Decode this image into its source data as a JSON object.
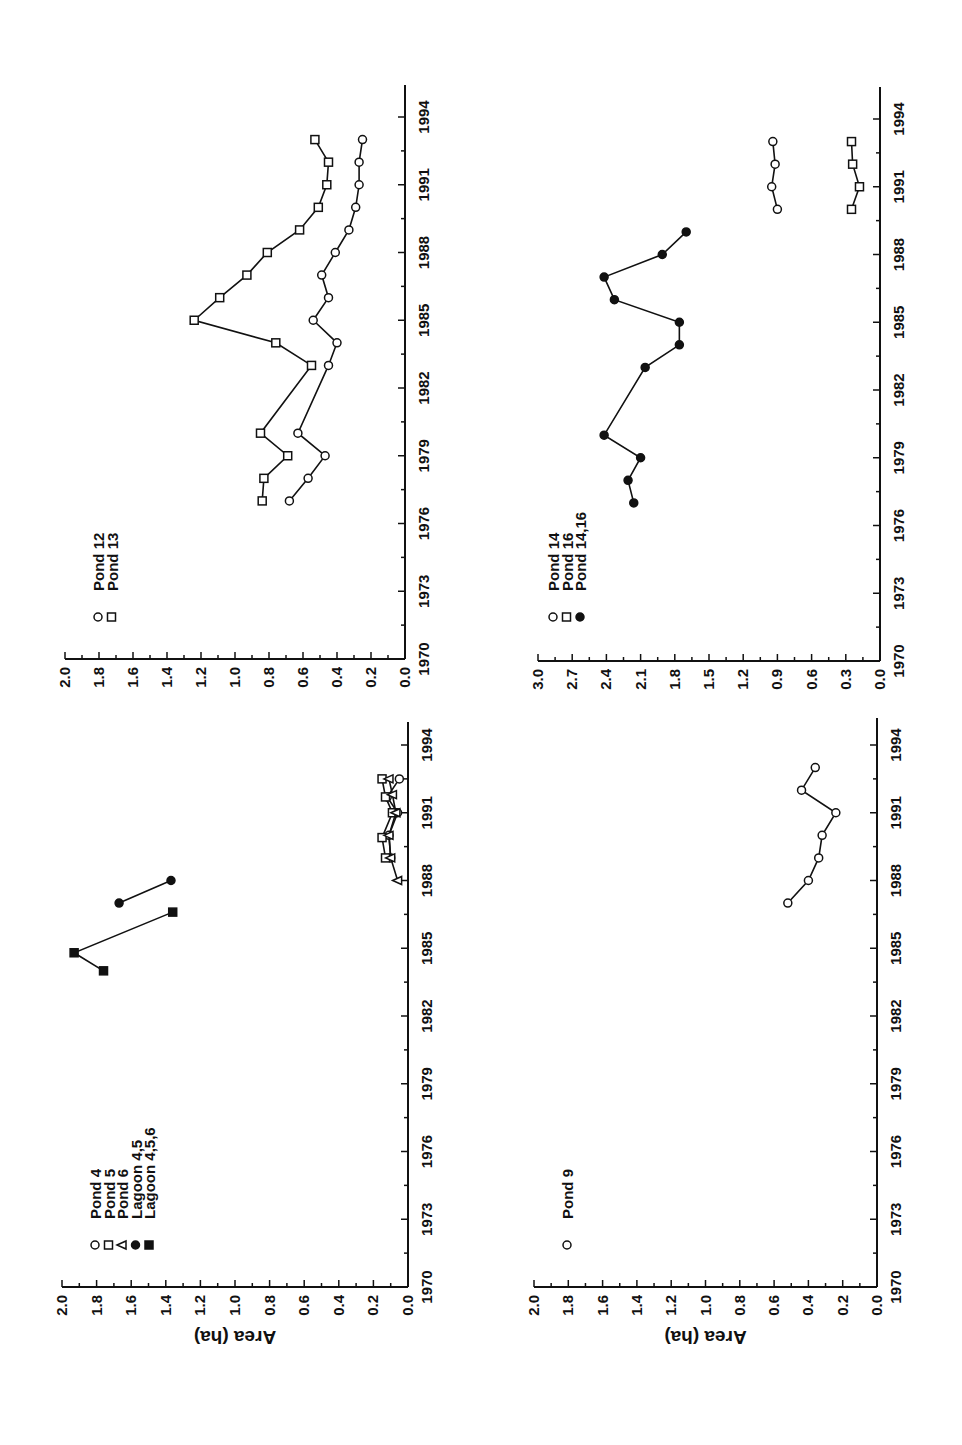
{
  "figure": {
    "orientation": "rotated 90 degrees counter-clockwise",
    "ylabel": "Area (ha)"
  },
  "chart_data": [
    {
      "type": "line",
      "panel": "ponds-4-5-6-lagoons",
      "title": "",
      "xlabel": "",
      "ylabel": "Area (ha)",
      "x_ticks": [
        "1970",
        "1973",
        "1976",
        "1979",
        "1982",
        "1985",
        "1988",
        "1991",
        "1994"
      ],
      "y_ticks": [
        "0.0",
        "0.2",
        "0.4",
        "0.6",
        "0.8",
        "1.0",
        "1.2",
        "1.4",
        "1.6",
        "1.8",
        "2.0"
      ],
      "xlim": [
        1970,
        1994
      ],
      "ylim": [
        0,
        2.0
      ],
      "legend": [
        {
          "label": "Pond 4",
          "marker": "open-circle"
        },
        {
          "label": "Pond 5",
          "marker": "open-square"
        },
        {
          "label": "Pond 6",
          "marker": "open-triangle"
        },
        {
          "label": "Lagoon 4,5",
          "marker": "filled-circle"
        },
        {
          "label": "Lagoon 4,5,6",
          "marker": "filled-square"
        }
      ],
      "series": [
        {
          "name": "Pond 4",
          "marker": "open-circle",
          "x": [
            1989,
            1990,
            1991,
            1991.7,
            1992.5
          ],
          "y": [
            0.1,
            0.11,
            0.06,
            0.12,
            0.05
          ]
        },
        {
          "name": "Pond 5",
          "marker": "open-square",
          "x": [
            1989,
            1989.9,
            1991,
            1991.7,
            1992.5
          ],
          "y": [
            0.13,
            0.15,
            0.09,
            0.13,
            0.15
          ]
        },
        {
          "name": "Pond 6",
          "marker": "open-triangle",
          "x": [
            1988,
            1989,
            1990,
            1991,
            1991.8,
            1992.5
          ],
          "y": [
            0.06,
            0.1,
            0.11,
            0.07,
            0.09,
            0.11
          ]
        },
        {
          "name": "Lagoon 4,5",
          "marker": "filled-circle",
          "x": [
            1987,
            1988
          ],
          "y": [
            1.67,
            1.37
          ]
        },
        {
          "name": "Lagoon 4,5,6",
          "marker": "filled-square",
          "x": [
            1984,
            1984.8,
            1986.6
          ],
          "y": [
            1.76,
            1.93,
            1.36
          ]
        }
      ]
    },
    {
      "type": "line",
      "panel": "ponds-12-13",
      "title": "",
      "xlabel": "",
      "ylabel": "",
      "x_ticks": [
        "1970",
        "1973",
        "1976",
        "1979",
        "1982",
        "1985",
        "1988",
        "1991",
        "1994"
      ],
      "y_ticks": [
        "0.0",
        "0.2",
        "0.4",
        "0.6",
        "0.8",
        "1.0",
        "1.2",
        "1.4",
        "1.6",
        "1.8",
        "2.0"
      ],
      "xlim": [
        1970,
        1994
      ],
      "ylim": [
        0,
        2.0
      ],
      "legend": [
        {
          "label": "Pond 12",
          "marker": "open-circle"
        },
        {
          "label": "Pond 13",
          "marker": "open-square"
        }
      ],
      "series": [
        {
          "name": "Pond 12",
          "marker": "open-circle",
          "x": [
            1977,
            1978,
            1979,
            1980,
            1983,
            1984,
            1985,
            1986,
            1987,
            1988,
            1989,
            1990,
            1991,
            1992,
            1993
          ],
          "y": [
            0.68,
            0.57,
            0.47,
            0.63,
            0.45,
            0.4,
            0.54,
            0.45,
            0.49,
            0.41,
            0.33,
            0.29,
            0.27,
            0.27,
            0.25
          ]
        },
        {
          "name": "Pond 13",
          "marker": "open-square",
          "x": [
            1977,
            1978,
            1979,
            1980,
            1983,
            1984,
            1985,
            1986,
            1987,
            1988,
            1989,
            1990,
            1991,
            1992,
            1993
          ],
          "y": [
            0.84,
            0.83,
            0.69,
            0.85,
            0.55,
            0.76,
            1.24,
            1.09,
            0.93,
            0.81,
            0.62,
            0.51,
            0.46,
            0.45,
            0.53
          ]
        }
      ]
    },
    {
      "type": "line",
      "panel": "pond-9",
      "title": "",
      "xlabel": "",
      "ylabel": "Area (ha)",
      "x_ticks": [
        "1970",
        "1973",
        "1976",
        "1979",
        "1982",
        "1985",
        "1988",
        "1991",
        "1994"
      ],
      "y_ticks": [
        "0.0",
        "0.2",
        "0.4",
        "0.6",
        "0.8",
        "1.0",
        "1.2",
        "1.4",
        "1.6",
        "1.8",
        "2.0"
      ],
      "xlim": [
        1970,
        1994
      ],
      "ylim": [
        0,
        2.0
      ],
      "legend": [
        {
          "label": "Pond 9",
          "marker": "open-circle"
        }
      ],
      "series": [
        {
          "name": "Pond 9",
          "marker": "open-circle",
          "x": [
            1987,
            1988,
            1989,
            1990,
            1991,
            1992,
            1993
          ],
          "y": [
            0.52,
            0.4,
            0.34,
            0.32,
            0.24,
            0.44,
            0.36
          ]
        }
      ]
    },
    {
      "type": "line",
      "panel": "ponds-14-16",
      "title": "",
      "xlabel": "",
      "ylabel": "",
      "x_ticks": [
        "1970",
        "1973",
        "1976",
        "1979",
        "1982",
        "1985",
        "1988",
        "1991",
        "1994"
      ],
      "y_ticks": [
        "0.0",
        "0.3",
        "0.6",
        "0.9",
        "1.2",
        "1.5",
        "1.8",
        "2.1",
        "2.4",
        "2.7",
        "3.0"
      ],
      "xlim": [
        1970,
        1994
      ],
      "ylim": [
        0,
        3.0
      ],
      "legend": [
        {
          "label": "Pond 14",
          "marker": "open-circle"
        },
        {
          "label": "Pond 16",
          "marker": "open-square"
        },
        {
          "label": "Pond 14,16",
          "marker": "filled-circle"
        }
      ],
      "series": [
        {
          "name": "Pond 14",
          "marker": "open-circle",
          "x": [
            1990,
            1991,
            1992,
            1993
          ],
          "y": [
            0.9,
            0.95,
            0.92,
            0.94
          ]
        },
        {
          "name": "Pond 16",
          "marker": "open-square",
          "x": [
            1990,
            1991,
            1992,
            1993
          ],
          "y": [
            0.25,
            0.18,
            0.24,
            0.25
          ]
        },
        {
          "name": "Pond 14,16",
          "marker": "filled-circle",
          "x": [
            1977,
            1978,
            1979,
            1980,
            1983,
            1984,
            1985,
            1986,
            1987,
            1988,
            1989
          ],
          "y": [
            2.16,
            2.21,
            2.1,
            2.42,
            2.06,
            1.76,
            1.76,
            2.33,
            2.42,
            1.91,
            1.7
          ]
        }
      ]
    }
  ]
}
